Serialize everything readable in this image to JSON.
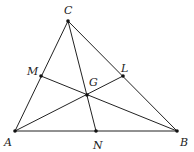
{
  "diagram": {
    "points": {
      "A": {
        "label": "A",
        "x": 15,
        "y": 131
      },
      "B": {
        "label": "B",
        "x": 177,
        "y": 131
      },
      "C": {
        "label": "C",
        "x": 68,
        "y": 21
      },
      "M": {
        "label": "M",
        "x": 41,
        "y": 76
      },
      "L": {
        "label": "L",
        "x": 123,
        "y": 76
      },
      "N": {
        "label": "N",
        "x": 96,
        "y": 131
      },
      "G": {
        "label": "G",
        "x": 87,
        "y": 95
      }
    },
    "segments": [
      [
        "A",
        "B"
      ],
      [
        "B",
        "C"
      ],
      [
        "C",
        "A"
      ],
      [
        "A",
        "L"
      ],
      [
        "B",
        "M"
      ],
      [
        "C",
        "N"
      ]
    ],
    "line_color": "#222222"
  }
}
